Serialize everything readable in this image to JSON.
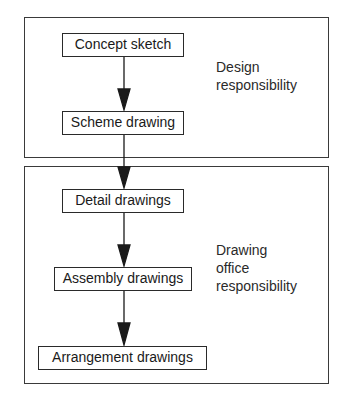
{
  "regions": [
    {
      "id": "design",
      "label_lines": [
        "Design",
        "responsibility"
      ]
    },
    {
      "id": "drawing-office",
      "label_lines": [
        "Drawing",
        "office",
        "responsibility"
      ]
    }
  ],
  "nodes": [
    {
      "id": "concept-sketch",
      "label": "Concept sketch",
      "region": "design"
    },
    {
      "id": "scheme-drawing",
      "label": "Scheme drawing",
      "region": "design"
    },
    {
      "id": "detail-drawings",
      "label": "Detail drawings",
      "region": "drawing-office"
    },
    {
      "id": "assembly-drawings",
      "label": "Assembly drawings",
      "region": "drawing-office"
    },
    {
      "id": "arrangement-drawings",
      "label": "Arrangement drawings",
      "region": "drawing-office"
    }
  ],
  "edges": [
    {
      "from": "concept-sketch",
      "to": "scheme-drawing"
    },
    {
      "from": "scheme-drawing",
      "to": "detail-drawings"
    },
    {
      "from": "detail-drawings",
      "to": "assembly-drawings"
    },
    {
      "from": "assembly-drawings",
      "to": "arrangement-drawings"
    }
  ]
}
